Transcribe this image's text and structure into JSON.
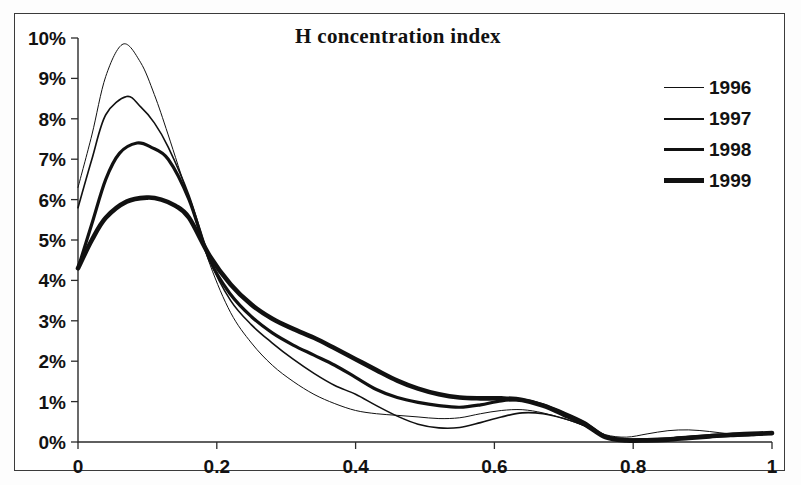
{
  "chart_data": {
    "type": "line",
    "title": "H concentration index",
    "xlabel": "",
    "ylabel": "",
    "xlim": [
      0,
      1
    ],
    "ylim": [
      0,
      0.1
    ],
    "grid": false,
    "legend_position": "top-right",
    "xticks": [
      0,
      0.2,
      0.4,
      0.6,
      0.8,
      1
    ],
    "xtick_labels": [
      "0",
      "0.2",
      "0.4",
      "0.6",
      "0.8",
      "1"
    ],
    "yticks": [
      0,
      0.01,
      0.02,
      0.03,
      0.04,
      0.05,
      0.06,
      0.07,
      0.08,
      0.09,
      0.1
    ],
    "ytick_labels": [
      "0%",
      "1%",
      "2%",
      "3%",
      "4%",
      "5%",
      "6%",
      "7%",
      "8%",
      "9%",
      "10%"
    ],
    "series": [
      {
        "name": "1996",
        "line_width": 1.0,
        "color": "#111111",
        "x": [
          0.0,
          0.02,
          0.04,
          0.065,
          0.09,
          0.11,
          0.13,
          0.16,
          0.19,
          0.22,
          0.25,
          0.28,
          0.31,
          0.34,
          0.37,
          0.4,
          0.43,
          0.46,
          0.49,
          0.52,
          0.55,
          0.58,
          0.61,
          0.64,
          0.67,
          0.7,
          0.73,
          0.76,
          0.79,
          0.82,
          0.85,
          0.88,
          0.91,
          0.94,
          0.97,
          1.0
        ],
        "y": [
          0.063,
          0.076,
          0.0905,
          0.0985,
          0.094,
          0.086,
          0.076,
          0.06,
          0.044,
          0.032,
          0.0245,
          0.019,
          0.015,
          0.0118,
          0.0095,
          0.0078,
          0.007,
          0.0066,
          0.0062,
          0.0058,
          0.006,
          0.007,
          0.0078,
          0.008,
          0.0072,
          0.0058,
          0.004,
          0.0018,
          0.0012,
          0.002,
          0.0028,
          0.003,
          0.0026,
          0.002,
          0.0018,
          0.002
        ]
      },
      {
        "name": "1997",
        "line_width": 1.6,
        "color": "#111111",
        "x": [
          0.0,
          0.02,
          0.04,
          0.07,
          0.09,
          0.11,
          0.13,
          0.16,
          0.19,
          0.22,
          0.25,
          0.28,
          0.31,
          0.34,
          0.37,
          0.4,
          0.43,
          0.46,
          0.49,
          0.52,
          0.55,
          0.58,
          0.61,
          0.64,
          0.67,
          0.7,
          0.73,
          0.76,
          0.79,
          0.82,
          0.85,
          0.88,
          0.91,
          0.94,
          0.97,
          1.0
        ],
        "y": [
          0.058,
          0.07,
          0.081,
          0.0855,
          0.083,
          0.079,
          0.073,
          0.061,
          0.045,
          0.035,
          0.029,
          0.0245,
          0.0205,
          0.017,
          0.014,
          0.0118,
          0.009,
          0.0064,
          0.0044,
          0.0035,
          0.0036,
          0.0048,
          0.0062,
          0.0072,
          0.007,
          0.0058,
          0.004,
          0.0012,
          0.0006,
          0.0006,
          0.0008,
          0.001,
          0.0012,
          0.0014,
          0.0016,
          0.002
        ]
      },
      {
        "name": "1998",
        "line_width": 3.2,
        "color": "#111111",
        "x": [
          0.0,
          0.02,
          0.04,
          0.06,
          0.085,
          0.105,
          0.13,
          0.16,
          0.19,
          0.22,
          0.25,
          0.28,
          0.31,
          0.34,
          0.37,
          0.4,
          0.43,
          0.46,
          0.49,
          0.52,
          0.55,
          0.58,
          0.61,
          0.64,
          0.67,
          0.7,
          0.73,
          0.76,
          0.79,
          0.82,
          0.85,
          0.88,
          0.91,
          0.94,
          0.97,
          1.0
        ],
        "y": [
          0.043,
          0.054,
          0.065,
          0.0715,
          0.074,
          0.073,
          0.07,
          0.06,
          0.045,
          0.0365,
          0.031,
          0.027,
          0.024,
          0.0215,
          0.019,
          0.016,
          0.013,
          0.011,
          0.0098,
          0.009,
          0.0086,
          0.0092,
          0.0102,
          0.0104,
          0.0092,
          0.0072,
          0.0048,
          0.0014,
          0.0006,
          0.0006,
          0.0008,
          0.0012,
          0.0016,
          0.0018,
          0.002,
          0.0022
        ]
      },
      {
        "name": "1999",
        "line_width": 4.6,
        "color": "#111111",
        "x": [
          0.0,
          0.02,
          0.04,
          0.07,
          0.1,
          0.12,
          0.14,
          0.16,
          0.19,
          0.22,
          0.25,
          0.28,
          0.31,
          0.34,
          0.37,
          0.4,
          0.43,
          0.46,
          0.49,
          0.52,
          0.55,
          0.58,
          0.61,
          0.64,
          0.67,
          0.7,
          0.73,
          0.76,
          0.79,
          0.82,
          0.85,
          0.88,
          0.91,
          0.94,
          0.97,
          1.0
        ],
        "y": [
          0.043,
          0.05,
          0.0555,
          0.0595,
          0.0605,
          0.06,
          0.0585,
          0.0555,
          0.046,
          0.039,
          0.034,
          0.0305,
          0.028,
          0.0258,
          0.0232,
          0.0205,
          0.0178,
          0.0152,
          0.0132,
          0.0118,
          0.011,
          0.0108,
          0.0108,
          0.0104,
          0.009,
          0.0068,
          0.0044,
          0.0012,
          0.0004,
          0.0004,
          0.0006,
          0.001,
          0.0014,
          0.0018,
          0.002,
          0.0022
        ]
      }
    ]
  },
  "legend": {
    "items": [
      {
        "label": "1996"
      },
      {
        "label": "1997"
      },
      {
        "label": "1998"
      },
      {
        "label": "1999"
      }
    ]
  }
}
